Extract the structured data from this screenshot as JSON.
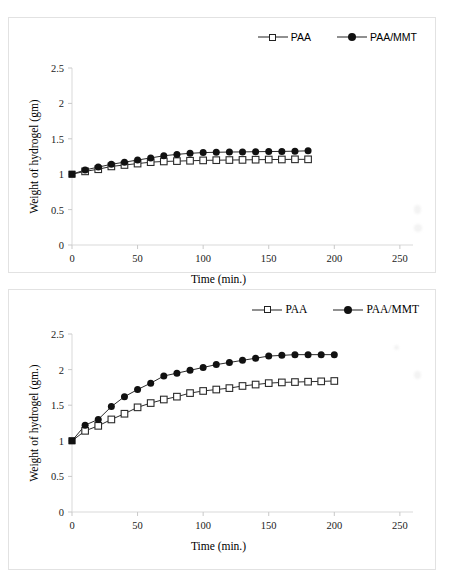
{
  "figure": {
    "panels": [
      "top-chart-panel",
      "bottom-chart-panel"
    ],
    "background_color": "#ffffff",
    "border_color": "#e2e2e2"
  },
  "chart_data": [
    {
      "id": "chart-top",
      "type": "line",
      "title": "",
      "xlabel": "Time (min.)",
      "ylabel": "Weight of hydrogel (gm)",
      "xlim": [
        0,
        260
      ],
      "ylim": [
        0,
        2.5
      ],
      "xticks": [
        0,
        50,
        100,
        150,
        200,
        250
      ],
      "yticks": [
        0,
        0.5,
        1,
        1.5,
        2,
        2.5
      ],
      "xticklabels": [
        "0",
        "50",
        "100",
        "150",
        "200",
        "250"
      ],
      "yticklabels": [
        "0",
        "0.5",
        "1",
        "1.5",
        "2",
        "2.5"
      ],
      "grid": false,
      "legend_position": "top-right",
      "legend_font": "sans-serif",
      "x": [
        0,
        10,
        20,
        30,
        40,
        50,
        60,
        70,
        80,
        90,
        100,
        110,
        120,
        130,
        140,
        150,
        160,
        170,
        180
      ],
      "series": [
        {
          "name": "PAA",
          "marker": "open-square",
          "values": [
            1.0,
            1.04,
            1.07,
            1.11,
            1.13,
            1.15,
            1.17,
            1.18,
            1.185,
            1.19,
            1.195,
            1.198,
            1.2,
            1.202,
            1.205,
            1.207,
            1.208,
            1.21,
            1.21
          ]
        },
        {
          "name": "PAA/MMT",
          "marker": "filled-circle",
          "values": [
            1.0,
            1.06,
            1.1,
            1.14,
            1.17,
            1.2,
            1.23,
            1.26,
            1.28,
            1.295,
            1.305,
            1.31,
            1.313,
            1.315,
            1.318,
            1.32,
            1.322,
            1.325,
            1.33
          ]
        }
      ]
    },
    {
      "id": "chart-bottom",
      "type": "line",
      "title": "",
      "xlabel": "Time (min.)",
      "ylabel": "Weight of hydrogel (gm.)",
      "xlim": [
        0,
        260
      ],
      "ylim": [
        0,
        2.5
      ],
      "xticks": [
        0,
        50,
        100,
        150,
        200,
        250
      ],
      "yticks": [
        0,
        0.5,
        1,
        1.5,
        2,
        2.5
      ],
      "xticklabels": [
        "0",
        "50",
        "100",
        "150",
        "200",
        "250"
      ],
      "yticklabels": [
        "0",
        "0.5",
        "1",
        "1.5",
        "2",
        "2.5"
      ],
      "grid": false,
      "legend_position": "top-right",
      "legend_font": "serif",
      "x": [
        0,
        10,
        20,
        30,
        40,
        50,
        60,
        70,
        80,
        90,
        100,
        110,
        120,
        130,
        140,
        150,
        160,
        170,
        180,
        190,
        200
      ],
      "series": [
        {
          "name": "PAA",
          "marker": "open-square",
          "values": [
            1.0,
            1.14,
            1.21,
            1.3,
            1.38,
            1.47,
            1.53,
            1.58,
            1.62,
            1.67,
            1.7,
            1.72,
            1.74,
            1.77,
            1.79,
            1.81,
            1.82,
            1.825,
            1.83,
            1.835,
            1.84
          ]
        },
        {
          "name": "PAA/MMT",
          "marker": "filled-circle",
          "values": [
            1.0,
            1.22,
            1.3,
            1.48,
            1.62,
            1.72,
            1.81,
            1.91,
            1.95,
            1.99,
            2.03,
            2.07,
            2.1,
            2.13,
            2.16,
            2.19,
            2.2,
            2.21,
            2.21,
            2.21,
            2.21
          ]
        }
      ]
    }
  ]
}
